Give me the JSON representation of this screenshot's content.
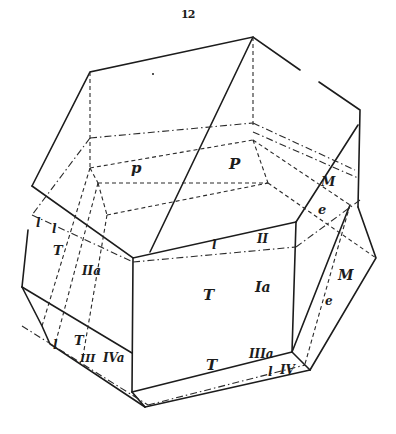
{
  "page": {
    "number": "12"
  },
  "figure": {
    "ink_color": "#1c1c1c",
    "background_color": "#ffffff",
    "labels": {
      "top_left_p": "p",
      "top_P": "P",
      "upper_right_M": "M",
      "upper_right_e": "e",
      "left_l": "l",
      "left_l2": "l",
      "left_T": "T",
      "left_IIa": "IIa",
      "center_l": "l",
      "center_II": "II",
      "center_T": "T",
      "center_Ia": "Ia",
      "right_M": "M",
      "right_e": "e",
      "lower_left_l": "l",
      "lower_left_T": "T",
      "lower_left_III": "III",
      "lower_left_IVa": "IVa",
      "bottom_T": "T",
      "bottom_IIIa": "IIIa",
      "bottom_l": "l",
      "bottom_IV": "IV"
    }
  }
}
